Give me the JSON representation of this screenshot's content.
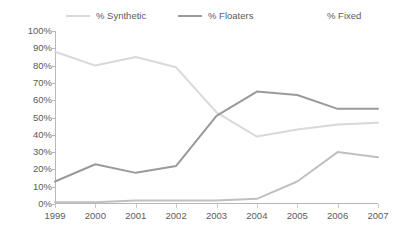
{
  "legend": {
    "items": [
      {
        "label": "% Synthetic",
        "color": "#d9d9d9",
        "show_swatch": true
      },
      {
        "label": "% Floaters",
        "color": "#9a9a9a",
        "show_swatch": true
      },
      {
        "label": "% Fixed",
        "color": "#ffffff",
        "show_swatch": false
      }
    ]
  },
  "axes": {
    "y_ticks": [
      "100%",
      "90%",
      "80%",
      "70%",
      "60%",
      "50%",
      "40%",
      "30%",
      "20%",
      "10%",
      "0%"
    ],
    "x_ticks": [
      "1999",
      "2000",
      "2001",
      "2002",
      "2003",
      "2004",
      "2005",
      "2006",
      "2007"
    ]
  },
  "chart_data": {
    "type": "line",
    "title": "",
    "subtitle": "",
    "xlabel": "",
    "ylabel": "",
    "categories": [
      "1999",
      "2000",
      "2001",
      "2002",
      "2003",
      "2004",
      "2005",
      "2006",
      "2007"
    ],
    "x": [
      1999,
      2000,
      2001,
      2002,
      2003,
      2004,
      2005,
      2006,
      2007
    ],
    "series": [
      {
        "name": "% Synthetic",
        "color": "#d9d9d9",
        "values": [
          88,
          80,
          85,
          79,
          53,
          39,
          43,
          46,
          47
        ]
      },
      {
        "name": "% Floaters",
        "color": "#9a9a9a",
        "values": [
          13,
          23,
          18,
          22,
          51,
          65,
          63,
          55,
          55
        ]
      },
      {
        "name": "% Fixed",
        "color": "#c0c0c0",
        "values": [
          1,
          1,
          2,
          2,
          2,
          3,
          13,
          30,
          27
        ]
      }
    ],
    "ylim": [
      0,
      100
    ],
    "ytick_step": 10,
    "ytick_format": "percent",
    "grid": false,
    "legend_position": "top"
  }
}
